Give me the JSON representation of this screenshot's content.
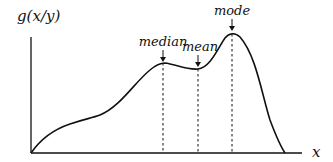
{
  "diagram": {
    "y_axis_label": "g(x/y)",
    "x_axis_label": "x",
    "annotations": [
      {
        "label": "median",
        "x": 163,
        "curve_y": 63,
        "label_y": 46
      },
      {
        "label": "mean",
        "x": 198,
        "curve_y": 69,
        "label_y": 51
      },
      {
        "label": "mode",
        "x": 232,
        "curve_y": 34,
        "label_y": 15
      }
    ],
    "colors": {
      "stroke": "#111111",
      "background": "#ffffff"
    }
  }
}
